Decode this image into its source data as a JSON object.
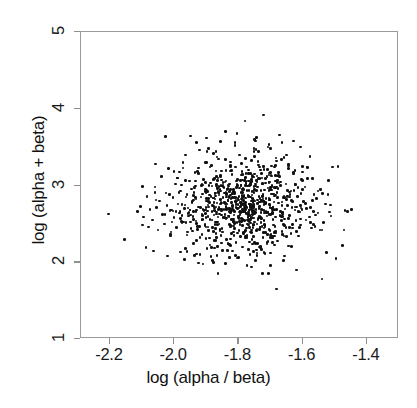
{
  "chart_data": {
    "type": "scatter",
    "title": "",
    "xlabel": "log (alpha / beta)",
    "ylabel": "log (alpha + beta)",
    "xlim": [
      -2.29,
      -1.3
    ],
    "ylim": [
      1.0,
      5.0
    ],
    "xticks": [
      -2.2,
      -2.0,
      -1.8,
      -1.6,
      -1.4
    ],
    "xticklabels": [
      "-2.2",
      "-2.0",
      "-1.8",
      "-1.6",
      "-1.4"
    ],
    "yticks": [
      1,
      2,
      3,
      4,
      5
    ],
    "yticklabels": [
      "1",
      "2",
      "3",
      "4",
      "5"
    ],
    "grid": false,
    "legend": null,
    "marker": {
      "style": "filled-circle",
      "color": "#111111",
      "size_px": 2.6
    },
    "frame_color": "#9a9a9a",
    "n_points": 900,
    "center": [
      -1.78,
      2.73
    ],
    "spread": [
      0.105,
      0.31
    ],
    "correlation": 0.12,
    "points": [
      [
        -2.205,
        2.63
      ],
      [
        -2.155,
        2.3
      ],
      [
        -2.115,
        2.66
      ],
      [
        -2.105,
        2.73
      ],
      [
        -2.095,
        2.59
      ],
      [
        -2.085,
        2.86
      ],
      [
        -2.08,
        2.46
      ],
      [
        -2.075,
        2.69
      ],
      [
        -2.068,
        2.55
      ],
      [
        -2.06,
        2.98
      ],
      [
        -2.055,
        2.71
      ],
      [
        -2.05,
        2.42
      ],
      [
        -2.046,
        2.8
      ],
      [
        -2.04,
        3.12
      ],
      [
        -2.036,
        2.62
      ],
      [
        -2.03,
        2.5
      ],
      [
        -2.026,
        2.9
      ],
      [
        -2.022,
        2.74
      ],
      [
        -2.018,
        3.22
      ],
      [
        -2.012,
        2.36
      ],
      [
        -2.008,
        2.68
      ],
      [
        -2.004,
        2.84
      ],
      [
        -2.0,
        2.58
      ],
      [
        -1.996,
        3.02
      ],
      [
        -1.992,
        2.45
      ],
      [
        -1.988,
        2.76
      ],
      [
        -1.984,
        2.64
      ],
      [
        -1.98,
        2.93
      ],
      [
        -1.976,
        2.52
      ],
      [
        -1.972,
        3.3
      ],
      [
        -1.968,
        2.7
      ],
      [
        -1.964,
        2.18
      ],
      [
        -1.96,
        2.88
      ],
      [
        -1.956,
        2.6
      ],
      [
        -1.952,
        3.06
      ],
      [
        -1.948,
        2.44
      ],
      [
        -1.944,
        2.78
      ],
      [
        -1.94,
        2.66
      ],
      [
        -1.936,
        2.97
      ],
      [
        -1.932,
        2.54
      ],
      [
        -1.928,
        3.18
      ],
      [
        -1.924,
        2.72
      ],
      [
        -1.92,
        2.32
      ],
      [
        -1.916,
        2.85
      ],
      [
        -1.912,
        2.61
      ],
      [
        -1.908,
        3.08
      ],
      [
        -1.904,
        2.48
      ],
      [
        -1.9,
        2.8
      ],
      [
        -1.896,
        2.67
      ],
      [
        -1.892,
        3.0
      ],
      [
        -1.888,
        2.56
      ],
      [
        -1.884,
        3.26
      ],
      [
        -1.88,
        2.74
      ],
      [
        -1.876,
        2.28
      ],
      [
        -1.872,
        2.9
      ],
      [
        -1.868,
        2.63
      ],
      [
        -1.864,
        3.1
      ],
      [
        -1.86,
        2.5
      ],
      [
        -1.856,
        2.82
      ],
      [
        -1.852,
        2.69
      ],
      [
        -1.848,
        3.04
      ],
      [
        -1.844,
        2.58
      ],
      [
        -1.84,
        3.34
      ],
      [
        -1.836,
        2.76
      ],
      [
        -1.832,
        2.24
      ],
      [
        -1.828,
        2.92
      ],
      [
        -1.824,
        2.65
      ],
      [
        -1.82,
        3.14
      ],
      [
        -1.816,
        2.53
      ],
      [
        -1.812,
        2.84
      ],
      [
        -1.808,
        2.71
      ],
      [
        -1.804,
        3.01
      ],
      [
        -1.8,
        2.6
      ],
      [
        -1.796,
        3.4
      ],
      [
        -1.792,
        2.78
      ],
      [
        -1.788,
        2.2
      ],
      [
        -1.784,
        2.95
      ],
      [
        -1.78,
        2.68
      ],
      [
        -1.776,
        3.16
      ],
      [
        -1.772,
        2.55
      ],
      [
        -1.768,
        2.86
      ],
      [
        -1.764,
        2.73
      ],
      [
        -1.76,
        3.05
      ],
      [
        -1.756,
        2.62
      ],
      [
        -1.752,
        3.44
      ],
      [
        -1.748,
        2.8
      ],
      [
        -1.744,
        2.16
      ],
      [
        -1.74,
        2.98
      ],
      [
        -1.736,
        2.7
      ],
      [
        -1.732,
        3.2
      ],
      [
        -1.728,
        2.57
      ],
      [
        -1.724,
        2.88
      ],
      [
        -1.72,
        2.75
      ],
      [
        -1.716,
        3.09
      ],
      [
        -1.712,
        2.64
      ],
      [
        -1.708,
        3.5
      ],
      [
        -1.704,
        2.82
      ],
      [
        -1.7,
        2.12
      ],
      [
        -1.696,
        3.0
      ],
      [
        -1.692,
        2.72
      ],
      [
        -1.688,
        3.24
      ],
      [
        -1.684,
        2.59
      ],
      [
        -1.68,
        2.91
      ],
      [
        -1.676,
        2.77
      ],
      [
        -1.672,
        3.12
      ],
      [
        -1.668,
        2.66
      ],
      [
        -1.664,
        3.56
      ],
      [
        -1.66,
        2.84
      ],
      [
        -1.656,
        2.08
      ],
      [
        -1.652,
        3.02
      ],
      [
        -1.648,
        2.74
      ],
      [
        -1.644,
        3.28
      ],
      [
        -1.64,
        2.61
      ],
      [
        -1.636,
        2.93
      ],
      [
        -1.632,
        2.79
      ],
      [
        -1.628,
        3.15
      ],
      [
        -1.624,
        2.68
      ],
      [
        -1.62,
        2.4
      ],
      [
        -1.616,
        2.86
      ],
      [
        -1.612,
        2.34
      ],
      [
        -1.6,
        2.95
      ],
      [
        -1.588,
        2.7
      ],
      [
        -1.576,
        2.52
      ],
      [
        -1.564,
        2.88
      ],
      [
        -1.552,
        2.64
      ],
      [
        -1.54,
        2.42
      ],
      [
        -1.528,
        2.76
      ],
      [
        -1.512,
        2.6
      ],
      [
        -1.496,
        2.05
      ],
      [
        -1.476,
        2.22
      ],
      [
        -1.46,
        2.66
      ],
      [
        -1.448,
        2.69
      ],
      [
        -1.93,
        3.56
      ],
      [
        -1.9,
        3.62
      ],
      [
        -1.87,
        3.44
      ],
      [
        -1.84,
        3.7
      ],
      [
        -1.81,
        3.52
      ],
      [
        -1.78,
        3.84
      ],
      [
        -1.75,
        3.6
      ],
      [
        -1.722,
        3.92
      ],
      [
        -1.7,
        3.48
      ],
      [
        -1.672,
        3.66
      ],
      [
        -1.65,
        3.4
      ],
      [
        -1.628,
        3.58
      ],
      [
        -1.606,
        3.5
      ],
      [
        -1.964,
        3.4
      ],
      [
        -1.99,
        3.1
      ],
      [
        -2.014,
        2.88
      ],
      [
        -1.7,
        1.96
      ],
      [
        -1.66,
        2.02
      ],
      [
        -1.62,
        1.9
      ],
      [
        -1.54,
        1.78
      ],
      [
        -1.88,
        2.02
      ],
      [
        -1.84,
        1.98
      ],
      [
        -1.8,
        2.06
      ],
      [
        -1.76,
        1.94
      ],
      [
        -1.96,
        2.14
      ],
      [
        -1.92,
        2.1
      ]
    ]
  }
}
